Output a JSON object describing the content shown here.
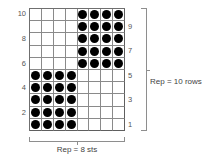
{
  "chart_data": {
    "type": "heatmap",
    "title": "",
    "columns": 8,
    "rows": 10,
    "symbol_filled": "dot",
    "symbol_empty": "blank",
    "fill_color": "#000000",
    "grid_line_color": "#8a8a8a",
    "background_color": "#ffffff",
    "legend": [],
    "grid": [
      [
        0,
        0,
        0,
        0,
        1,
        1,
        1,
        1
      ],
      [
        0,
        0,
        0,
        0,
        1,
        1,
        1,
        1
      ],
      [
        0,
        0,
        0,
        0,
        1,
        1,
        1,
        1
      ],
      [
        0,
        0,
        0,
        0,
        1,
        1,
        1,
        1
      ],
      [
        0,
        0,
        0,
        0,
        1,
        1,
        1,
        1
      ],
      [
        1,
        1,
        1,
        1,
        0,
        0,
        0,
        0
      ],
      [
        1,
        1,
        1,
        1,
        0,
        0,
        0,
        0
      ],
      [
        1,
        1,
        1,
        1,
        0,
        0,
        0,
        0
      ],
      [
        1,
        1,
        1,
        1,
        0,
        0,
        0,
        0
      ],
      [
        1,
        1,
        1,
        1,
        0,
        0,
        0,
        0
      ]
    ],
    "row_order_top_to_bottom": [
      10,
      9,
      8,
      7,
      6,
      5,
      4,
      3,
      2,
      1
    ],
    "left_row_labels": [
      "10",
      "",
      "8",
      "",
      "6",
      "",
      "4",
      "",
      "2",
      ""
    ],
    "right_row_labels": [
      "",
      "9",
      "",
      "7",
      "",
      "5",
      "",
      "3",
      "",
      "1"
    ],
    "annotations": {
      "rows_repeat": "Rep = 10 rows",
      "stitches_repeat": "Rep = 8 sts"
    }
  }
}
